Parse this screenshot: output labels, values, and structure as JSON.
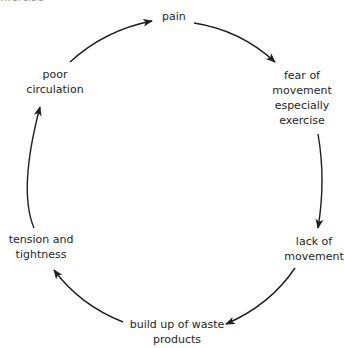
{
  "diagram": {
    "type": "cycle",
    "top_cutoff_text": "…ercise",
    "nodes": [
      {
        "id": "pain",
        "lines": [
          "pain"
        ]
      },
      {
        "id": "fear",
        "lines": [
          "fear of",
          "movement",
          "especially",
          "exercise"
        ]
      },
      {
        "id": "lack",
        "lines": [
          "lack of",
          "movement"
        ]
      },
      {
        "id": "waste",
        "lines": [
          "build up of waste",
          "products"
        ]
      },
      {
        "id": "tension",
        "lines": [
          "tension and",
          "tightness"
        ]
      },
      {
        "id": "circulation",
        "lines": [
          "poor",
          "circulation"
        ]
      }
    ],
    "edges": [
      {
        "from": "pain",
        "to": "fear"
      },
      {
        "from": "fear",
        "to": "lack"
      },
      {
        "from": "lack",
        "to": "waste"
      },
      {
        "from": "waste",
        "to": "tension"
      },
      {
        "from": "tension",
        "to": "circulation"
      },
      {
        "from": "circulation",
        "to": "pain"
      }
    ],
    "colors": {
      "arrow": "#1e1e1e",
      "text": "#1e1e1e",
      "background": "#ffffff"
    }
  }
}
